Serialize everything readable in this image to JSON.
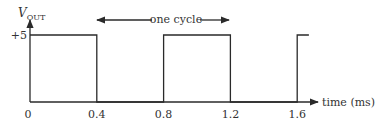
{
  "diagram": {
    "type": "square-wave-timing",
    "y_axis": {
      "label_main": "V",
      "label_sub": "OUT",
      "level_label": "+5",
      "level_value": 5
    },
    "x_axis": {
      "label": "time (ms)",
      "ticks": [
        "0",
        "0.4",
        "0.8",
        "1.2",
        "1.6"
      ],
      "tick_values": [
        0,
        0.4,
        0.8,
        1.2,
        1.6
      ]
    },
    "annotation": {
      "text": "one cycle",
      "from": 0.4,
      "to": 1.2
    },
    "waveform": {
      "high_level": 5,
      "low_level": 0,
      "high_intervals": [
        [
          0,
          0.4
        ],
        [
          0.8,
          1.2
        ],
        [
          1.6,
          1.67
        ]
      ]
    }
  },
  "chart_data": {
    "type": "line",
    "title": "",
    "xlabel": "time (ms)",
    "ylabel": "V_OUT",
    "x": [
      0,
      0,
      0.4,
      0.4,
      0.8,
      0.8,
      1.2,
      1.2,
      1.6,
      1.6,
      1.67
    ],
    "series": [
      {
        "name": "V_OUT",
        "values": [
          5,
          5,
          5,
          0,
          0,
          5,
          5,
          0,
          0,
          5,
          5
        ]
      }
    ],
    "xticks": [
      "0",
      "0.4",
      "0.8",
      "1.2",
      "1.6"
    ],
    "yticks": [
      "+5"
    ],
    "xlim": [
      0,
      1.8
    ],
    "ylim": [
      0,
      5.5
    ],
    "grid": false,
    "legend": "none",
    "annotations": [
      {
        "text": "one cycle",
        "span": [
          0.4,
          1.2
        ]
      }
    ]
  }
}
